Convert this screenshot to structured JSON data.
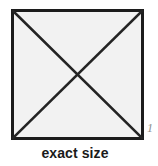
{
  "figure": {
    "caption": "exact size",
    "figure_number": "1",
    "colors": {
      "background": "#ffffff",
      "square_fill": "#f2f2f2",
      "square_stroke": "#1c1c1c",
      "diagonal_stroke": "#242424",
      "caption_text": "#1a1a1a",
      "figure_number_text": "#8d8d8d"
    },
    "shape": {
      "name": "square-with-diagonals",
      "border_width_px": 3,
      "diagonal_width_px": 2.6,
      "corners": {
        "top_left": [
          0,
          0
        ],
        "top_right": [
          133,
          0
        ],
        "bottom_right": [
          133,
          131
        ],
        "bottom_left": [
          0,
          131
        ]
      },
      "diagonals": [
        {
          "name": "diagonal-top-left-to-bottom-right",
          "from": [
            0,
            0
          ],
          "to": [
            133,
            131
          ]
        },
        {
          "name": "diagonal-top-right-to-bottom-left",
          "from": [
            133,
            0
          ],
          "to": [
            0,
            131
          ]
        }
      ],
      "intersection_point": [
        66.5,
        65.5
      ]
    }
  }
}
